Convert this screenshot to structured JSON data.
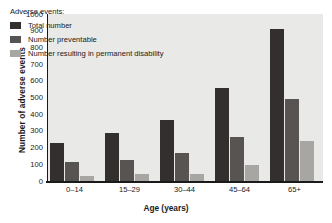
{
  "chart_data": {
    "type": "bar",
    "title": "",
    "xlabel": "Age (years)",
    "ylabel": "Number of adverse events",
    "categories": [
      "0–14",
      "15–29",
      "30–44",
      "45–64",
      "65+"
    ],
    "series": [
      {
        "name": "Total number",
        "color": "#332f2e",
        "values": [
          225,
          290,
          365,
          555,
          912
        ]
      },
      {
        "name": "Number preventable",
        "color": "#585452",
        "values": [
          115,
          127,
          167,
          263,
          490
        ]
      },
      {
        "name": "Number resulting in permanent disability",
        "color": "#a8a6a3",
        "values": [
          30,
          45,
          45,
          97,
          240
        ]
      }
    ],
    "ylim": [
      0,
      1000
    ],
    "yticks": [
      0,
      100,
      200,
      300,
      400,
      500,
      600,
      700,
      800,
      900,
      1000
    ],
    "ytick_labels": [
      "0",
      "100",
      "200",
      "300",
      "400",
      "500",
      "600",
      "700",
      "800",
      "900",
      "1000"
    ],
    "grid": false,
    "legend_position": "upper-left",
    "legend_title": "Adverse events:",
    "plot_background": "#e9e9e7",
    "axis_color": "#1a1a1a"
  }
}
